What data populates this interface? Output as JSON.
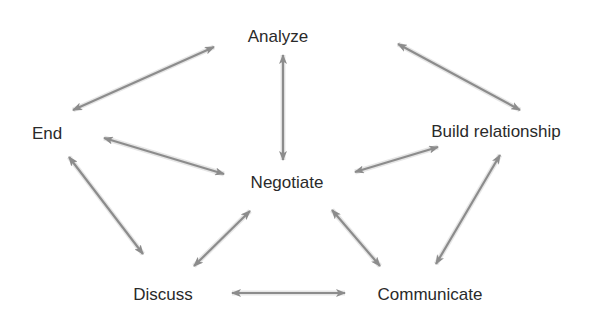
{
  "diagram": {
    "type": "cycle-network",
    "arrow_color": "#8c8c8c",
    "text_color": "#2a2a2a",
    "nodes": [
      {
        "id": "analyze",
        "label": "Analyze",
        "x": 278,
        "y": 42
      },
      {
        "id": "end",
        "label": "End",
        "x": 47,
        "y": 139
      },
      {
        "id": "build",
        "label": "Build relationship",
        "x": 496,
        "y": 137
      },
      {
        "id": "negotiate",
        "label": "Negotiate",
        "x": 287,
        "y": 188
      },
      {
        "id": "discuss",
        "label": "Discuss",
        "x": 163,
        "y": 300
      },
      {
        "id": "communicate",
        "label": "Communicate",
        "x": 430,
        "y": 300
      }
    ],
    "edges": [
      {
        "from": "end",
        "to": "analyze",
        "bidirectional": true,
        "x1": 73,
        "y1": 110,
        "x2": 214,
        "y2": 47
      },
      {
        "from": "analyze",
        "to": "negotiate",
        "bidirectional": true,
        "x1": 283,
        "y1": 55,
        "x2": 283,
        "y2": 160
      },
      {
        "from": "analyze",
        "to": "build",
        "bidirectional": true,
        "x1": 398,
        "y1": 44,
        "x2": 520,
        "y2": 110
      },
      {
        "from": "end",
        "to": "negotiate",
        "bidirectional": true,
        "x1": 104,
        "y1": 138,
        "x2": 224,
        "y2": 174
      },
      {
        "from": "build",
        "to": "negotiate",
        "bidirectional": true,
        "x1": 438,
        "y1": 147,
        "x2": 355,
        "y2": 172
      },
      {
        "from": "end",
        "to": "discuss",
        "bidirectional": true,
        "x1": 69,
        "y1": 157,
        "x2": 143,
        "y2": 254
      },
      {
        "from": "build",
        "to": "communicate",
        "bidirectional": true,
        "x1": 500,
        "y1": 155,
        "x2": 436,
        "y2": 264
      },
      {
        "from": "negotiate",
        "to": "discuss",
        "bidirectional": true,
        "x1": 250,
        "y1": 211,
        "x2": 194,
        "y2": 266
      },
      {
        "from": "negotiate",
        "to": "communicate",
        "bidirectional": true,
        "x1": 332,
        "y1": 210,
        "x2": 380,
        "y2": 266
      },
      {
        "from": "discuss",
        "to": "communicate",
        "bidirectional": true,
        "x1": 232,
        "y1": 293,
        "x2": 345,
        "y2": 293
      }
    ]
  }
}
